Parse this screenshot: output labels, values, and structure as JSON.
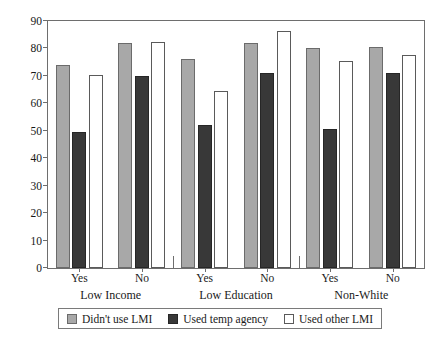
{
  "chart_data": {
    "type": "bar",
    "title": "",
    "subtitle": "",
    "xlabel": "",
    "ylabel": "",
    "ylim": [
      0,
      90
    ],
    "yticks": [
      0,
      10,
      20,
      30,
      40,
      50,
      60,
      70,
      80,
      90
    ],
    "grid": false,
    "legend_position": "bottom",
    "categories": [
      "Yes",
      "No",
      "Yes",
      "No",
      "Yes",
      "No"
    ],
    "groups": [
      {
        "name": "Low Income",
        "subcategories": [
          "Yes",
          "No"
        ]
      },
      {
        "name": "Low Education",
        "subcategories": [
          "Yes",
          "No"
        ]
      },
      {
        "name": "Non-White",
        "subcategories": [
          "Yes",
          "No"
        ]
      }
    ],
    "series": [
      {
        "name": "Didn't use LMI",
        "color": "#a8a8a8",
        "values": [
          74,
          82,
          76,
          82,
          80,
          80.5
        ]
      },
      {
        "name": "Used temp agency",
        "color": "#383838",
        "values": [
          49.5,
          70,
          52,
          71,
          50.5,
          71
        ]
      },
      {
        "name": "Used other LMI",
        "color": "#ffffff",
        "values": [
          70.5,
          82.5,
          64.5,
          86.5,
          75.5,
          77.5
        ]
      }
    ]
  },
  "legend": {
    "items": [
      {
        "label": "Didn't use LMI",
        "swatch": "gray-swatch"
      },
      {
        "label": "Used temp agency",
        "swatch": "dark-swatch"
      },
      {
        "label": "Used other LMI",
        "swatch": "white-swatch"
      }
    ]
  },
  "colors": {
    "series_gray": "#a8a8a8",
    "series_dark": "#383838",
    "series_white": "#ffffff",
    "axis": "#6e6e6e",
    "text": "#1a1a1a",
    "background": "#ffffff"
  }
}
